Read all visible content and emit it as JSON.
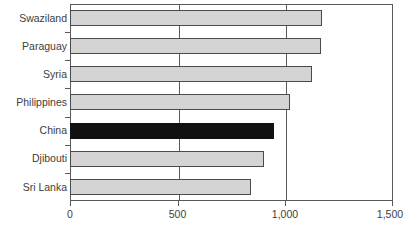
{
  "chart_data": {
    "type": "bar",
    "orientation": "horizontal",
    "title": "",
    "xlabel": "",
    "ylabel": "",
    "xlim": [
      0,
      1500
    ],
    "xticks": [
      0,
      500,
      1000,
      1500
    ],
    "xtick_labels": [
      "0",
      "500",
      "1,000",
      "1,500"
    ],
    "grid": true,
    "grid_axis": "x",
    "legend": false,
    "categories": [
      "Swaziland",
      "Paraguay",
      "Syria",
      "Philippines",
      "China",
      "Djibouti",
      "Sri Lanka"
    ],
    "values": [
      1170,
      1165,
      1125,
      1020,
      948,
      900,
      840
    ],
    "highlight_category": "China",
    "colors": {
      "bar_fill": "#d4d4d4",
      "bar_border": "#4a4a4a",
      "highlight_fill": "#111111",
      "axis": "#5a5a5a",
      "text": "#3d3d3d",
      "background": "#ffffff"
    }
  }
}
